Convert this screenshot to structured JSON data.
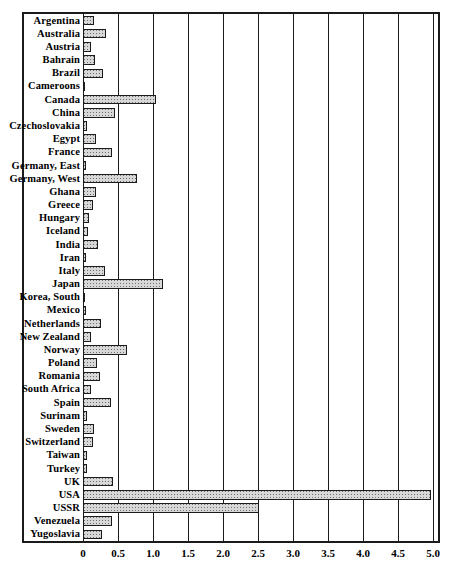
{
  "chart_data": {
    "type": "bar",
    "orientation": "horizontal",
    "title": "",
    "subtitle": "",
    "xlabel": "",
    "ylabel": "",
    "xlim": [
      0,
      5.0
    ],
    "xticks": [
      "0",
      "0.5",
      "1.0",
      "1.5",
      "2.0",
      "2.5",
      "3.0",
      "3.5",
      "4.0",
      "4.5",
      "5.0"
    ],
    "xtick_values": [
      0,
      0.5,
      1.0,
      1.5,
      2.0,
      2.5,
      3.0,
      3.5,
      4.0,
      4.5,
      5.0
    ],
    "grid": true,
    "grid_axis": "x",
    "legend": "none",
    "bar_fill": "#d8d8d8",
    "bar_edge": "#1b1b1b",
    "frame_color": "#1b1b1b",
    "background": "#ffffff",
    "categories": [
      "Argentina",
      "Australia",
      "Austria",
      "Bahrain",
      "Brazil",
      "Cameroons",
      "Canada",
      "China",
      "Czechoslovakia",
      "Egypt",
      "France",
      "Germany, East",
      "Germany, West",
      "Ghana",
      "Greece",
      "Hungary",
      "Iceland",
      "India",
      "Iran",
      "Italy",
      "Japan",
      "Korea, South",
      "Mexico",
      "Netherlands",
      "New Zealand",
      "Norway",
      "Poland",
      "Romania",
      "South Africa",
      "Spain",
      "Surinam",
      "Sweden",
      "Switzerland",
      "Taiwan",
      "Turkey",
      "UK",
      "USA",
      "USSR",
      "Venezuela",
      "Yugoslavia"
    ],
    "values": [
      0.16,
      0.33,
      0.12,
      0.17,
      0.28,
      0.03,
      1.04,
      0.46,
      0.05,
      0.18,
      0.41,
      0.04,
      0.77,
      0.19,
      0.14,
      0.08,
      0.07,
      0.22,
      0.04,
      0.31,
      1.14,
      0.03,
      0.04,
      0.26,
      0.12,
      0.63,
      0.2,
      0.24,
      0.12,
      0.4,
      0.06,
      0.15,
      0.14,
      0.05,
      0.05,
      0.43,
      4.97,
      2.52,
      0.42,
      0.27
    ]
  }
}
